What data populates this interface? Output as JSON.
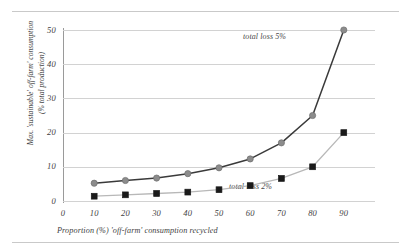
{
  "figure": {
    "has_top_rule": true,
    "has_bottom_rule": true,
    "background_color": "#ffffff",
    "rule_color": "#c9c9c9"
  },
  "chart_data": {
    "type": "line",
    "title": "",
    "xlabel": "Proportion (%) 'off-farm' consumption recycled",
    "ylabel": "Max. 'sustainable' off-farm' consumption\n(% total production)",
    "ylabel_line1": "Max. 'sustainable' off-farm' consumption",
    "ylabel_line2": "(% total production)",
    "x": [
      10,
      20,
      30,
      40,
      50,
      60,
      70,
      80,
      90
    ],
    "xlim": [
      0,
      100
    ],
    "ylim": [
      0,
      50
    ],
    "xticks": [
      "0",
      "10",
      "20",
      "30",
      "40",
      "50",
      "60",
      "70",
      "80",
      "90"
    ],
    "xtick_values": [
      0,
      10,
      20,
      30,
      40,
      50,
      60,
      70,
      80,
      90
    ],
    "yticks": [
      "0",
      "10",
      "20",
      "30",
      "40",
      "50"
    ],
    "ytick_values": [
      0,
      10,
      20,
      30,
      40,
      50
    ],
    "grid": "horizontal",
    "grid_color": "#d2d2d2",
    "legend_position": "inline-annotation",
    "series": [
      {
        "name": "total loss 5%",
        "annotation": "total loss 5%",
        "values": [
          5.2,
          6.0,
          6.7,
          8.0,
          9.7,
          12.3,
          17.0,
          25.0,
          50.0
        ],
        "line_color": "#3a3a3a",
        "marker": "circle",
        "marker_color": "#8c8c8c",
        "marker_edge_color": "#6e6e6e"
      },
      {
        "name": "total loss 2%",
        "annotation": "total loss 2%",
        "values": [
          1.4,
          1.8,
          2.2,
          2.6,
          3.3,
          4.5,
          6.6,
          10.0,
          20.0
        ],
        "line_color": "#b8b8b8",
        "marker": "square",
        "marker_color": "#1a1a1a",
        "marker_edge_color": "#1a1a1a"
      }
    ]
  }
}
